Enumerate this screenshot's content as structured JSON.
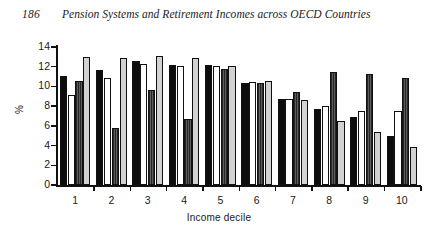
{
  "running_head": {
    "folio": "186",
    "title": "Pension Systems and Retirement Incomes across OECD Countries"
  },
  "chart_data": {
    "type": "bar",
    "title": "",
    "subtitle": "",
    "xlabel": "Income decile",
    "ylabel": "%",
    "categories": [
      "1",
      "2",
      "3",
      "4",
      "5",
      "6",
      "7",
      "8",
      "9",
      "10"
    ],
    "ylim": [
      0,
      14
    ],
    "yticks": [
      0,
      2,
      4,
      6,
      8,
      10,
      12,
      14
    ],
    "ytick_labels": [
      "0",
      "2",
      "4",
      "6",
      "8",
      "10",
      "12",
      "14"
    ],
    "grid": false,
    "legend": "none",
    "series": [
      {
        "name": "series-1",
        "color": "#0d0d0d",
        "values": [
          11.1,
          11.7,
          12.6,
          12.2,
          12.2,
          10.4,
          8.7,
          7.7,
          6.9,
          5.0
        ]
      },
      {
        "name": "series-2",
        "color": "#ffffff",
        "values": [
          9.1,
          10.9,
          12.3,
          12.1,
          12.1,
          10.5,
          8.7,
          8.0,
          7.5,
          7.5
        ]
      },
      {
        "name": "series-3",
        "color": "#4a4a4a",
        "values": [
          10.6,
          5.8,
          9.6,
          6.7,
          11.8,
          10.4,
          9.4,
          11.5,
          11.3,
          10.9
        ]
      },
      {
        "name": "series-4",
        "color": "#d2d2d2",
        "values": [
          13.0,
          12.9,
          13.1,
          12.9,
          12.1,
          10.6,
          8.6,
          6.5,
          5.4,
          3.9
        ]
      }
    ]
  }
}
